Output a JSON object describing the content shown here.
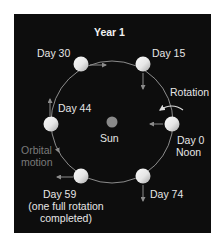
{
  "title": "Year 1",
  "center_label": "Sun",
  "orbital_motion_label": [
    "Orbital",
    "motion"
  ],
  "rotation_label": "Rotation",
  "positions": [
    {
      "label": "Day 0",
      "sublabel": "Noon"
    },
    {
      "label": "Day 15"
    },
    {
      "label": "Day 30"
    },
    {
      "label": "Day 44"
    },
    {
      "label": "Day 59",
      "sublabel": [
        "(one full rotation",
        "completed)"
      ]
    },
    {
      "label": "Day 74"
    }
  ],
  "colors": {
    "background": "#0d0d0d",
    "orbit": "#9a9a9a",
    "planet_light": "#f4f4f4",
    "planet_dark": "#b8b8b8",
    "sun": "#8a8a8a",
    "arrow": "#8c8c8c",
    "text": "#e6e6e6",
    "orbital_text": "#7a7a7a"
  }
}
